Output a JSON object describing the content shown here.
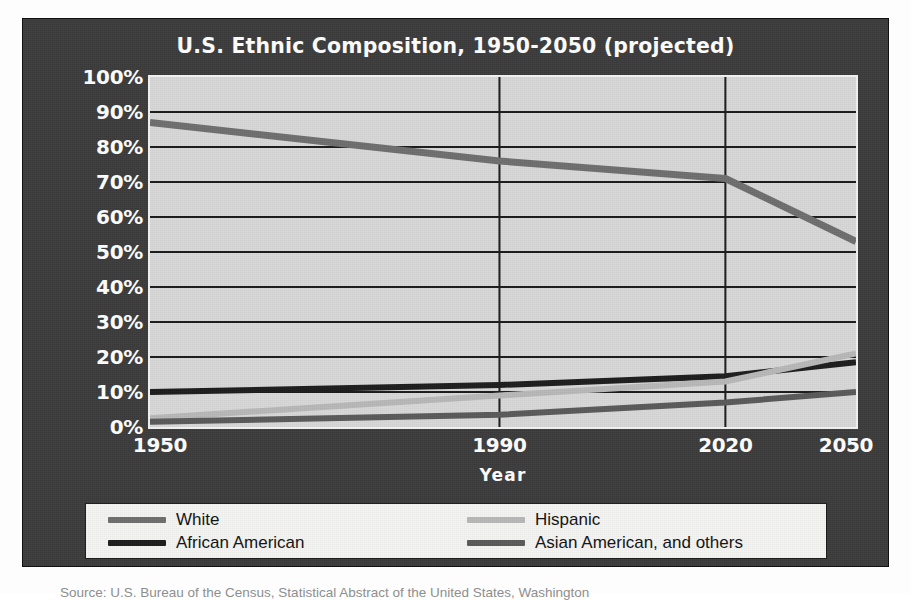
{
  "figure": {
    "background_color": "#3b3b3b",
    "plot_background_color": "#d7d7d7",
    "caption": "Source: U.S. Bureau of the Census, Statistical Abstract of the United States, Washington"
  },
  "legend": {
    "position": "bottom",
    "entries": [
      {
        "label": "White",
        "color": "#6e6e6e"
      },
      {
        "label": "African American",
        "color": "#1c1c1c"
      },
      {
        "label": "Hispanic",
        "color": "#b8b8b8"
      },
      {
        "label": "Asian American, and others",
        "color": "#595959"
      }
    ]
  },
  "chart_data": {
    "type": "line",
    "title": "U.S. Ethnic Composition, 1950-2050 (projected)",
    "xlabel": "Year",
    "ylabel": "",
    "x": [
      1950,
      1990,
      2020,
      2050
    ],
    "xtick_labels": [
      "1950",
      "1990",
      "2020",
      "2050"
    ],
    "xtick_positions_pct": [
      0,
      49.5,
      81.5,
      100
    ],
    "ylim": [
      0,
      100
    ],
    "ytick_labels": [
      "0%",
      "10%",
      "20%",
      "30%",
      "40%",
      "50%",
      "60%",
      "70%",
      "80%",
      "90%",
      "100%"
    ],
    "ytick_values": [
      0,
      10,
      20,
      30,
      40,
      50,
      60,
      70,
      80,
      90,
      100
    ],
    "grid": true,
    "grid_horizontal": true,
    "grid_vertical": true,
    "series": [
      {
        "name": "White",
        "color": "#6e6e6e",
        "width": 7,
        "values": [
          87,
          76,
          71,
          53
        ]
      },
      {
        "name": "African American",
        "color": "#1c1c1c",
        "width": 6,
        "values": [
          10,
          12,
          14.5,
          18.5
        ]
      },
      {
        "name": "Hispanic",
        "color": "#b8b8b8",
        "width": 6,
        "values": [
          2.5,
          9,
          13,
          21
        ]
      },
      {
        "name": "Asian American, and others",
        "color": "#595959",
        "width": 6,
        "values": [
          1.5,
          3.5,
          7,
          10
        ]
      }
    ]
  }
}
